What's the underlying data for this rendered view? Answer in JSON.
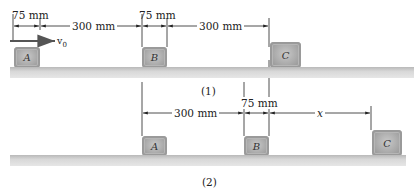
{
  "figure": {
    "panel1": {
      "caption": "(1)",
      "dims": {
        "gap_a_label": "75 mm",
        "span_ab_label": "300 mm",
        "gap_b_label": "75 mm",
        "span_bc_label": "300 mm"
      },
      "velocity_label": "v",
      "velocity_subscript": "0",
      "blocks": [
        {
          "label": "A"
        },
        {
          "label": "B"
        },
        {
          "label": "C"
        }
      ]
    },
    "panel2": {
      "caption": "(2)",
      "dims": {
        "span_ab_label": "300 mm",
        "gap_b_label": "75 mm",
        "span_bc_label": "x"
      },
      "blocks": [
        {
          "label": "A"
        },
        {
          "label": "B"
        },
        {
          "label": "C"
        }
      ]
    },
    "colors": {
      "block": "#a9a9a9",
      "ground": "#d0d0d0",
      "line": "#222222",
      "velocity_arrow": "#555555"
    }
  }
}
